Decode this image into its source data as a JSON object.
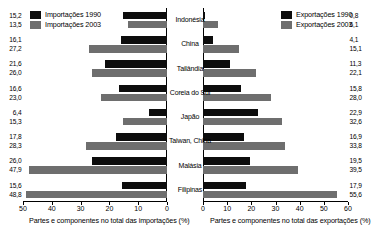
{
  "chart_data": {
    "type": "bar",
    "orientation": "horizontal",
    "layout": "back-to-back paired panels",
    "categories": [
      "Indonésia",
      "China",
      "Tailândia",
      "Coreia do Sul",
      "Japão",
      "Taiwan, China",
      "Malásia",
      "Filipinas"
    ],
    "panels": [
      {
        "id": "imports",
        "side": "left",
        "xlabel": "Partes e componentes no total das importações (%)",
        "xlim": [
          0,
          50
        ],
        "direction": "right-to-left",
        "ticks": [
          50,
          40,
          30,
          20,
          10,
          0
        ],
        "tick_labels": [
          "50",
          "40",
          "30",
          "20",
          "10",
          "0"
        ],
        "legend_position": "top-left",
        "series": [
          {
            "name": "Importações 1990",
            "color": "#0d0d0d",
            "values": [
              15.2,
              16.1,
              21.6,
              16.6,
              6.4,
              17.8,
              26.0,
              15.6
            ],
            "labels": [
              "15,2",
              "16,1",
              "21,6",
              "16,6",
              "6,4",
              "17,8",
              "26,0",
              "15,6"
            ]
          },
          {
            "name": "Importações 2003",
            "color": "#6e6e6e",
            "values": [
              13.5,
              27.2,
              26.0,
              23.0,
              15.3,
              28.3,
              47.9,
              48.8
            ],
            "labels": [
              "13,5",
              "27,2",
              "26,0",
              "23,0",
              "15,3",
              "28,3",
              "47,9",
              "48,8"
            ]
          }
        ]
      },
      {
        "id": "exports",
        "side": "right",
        "xlabel": "Partes e componentes no total das exportações (%)",
        "xlim": [
          0,
          60
        ],
        "direction": "left-to-right",
        "ticks": [
          0,
          10,
          20,
          30,
          40,
          50,
          60
        ],
        "tick_labels": [
          "0",
          "10",
          "20",
          "30",
          "40",
          "50",
          "60"
        ],
        "legend_position": "top-right",
        "series": [
          {
            "name": "Exportações 1990",
            "color": "#0d0d0d",
            "values": [
              0.8,
              4.1,
              11.3,
              15.8,
              22.9,
              16.9,
              19.5,
              17.9
            ],
            "labels": [
              "0,8",
              "4,1",
              "11,3",
              "15,8",
              "22,9",
              "16,9",
              "19,5",
              "17,9"
            ]
          },
          {
            "name": "Exportações 2003",
            "color": "#6e6e6e",
            "values": [
              6.1,
              15.1,
              22.1,
              28.0,
              32.6,
              33.8,
              39.5,
              55.6
            ],
            "labels": [
              "6,1",
              "15,1",
              "22,1",
              "28,0",
              "32,6",
              "33,8",
              "39,5",
              "55,6"
            ]
          }
        ]
      }
    ]
  }
}
